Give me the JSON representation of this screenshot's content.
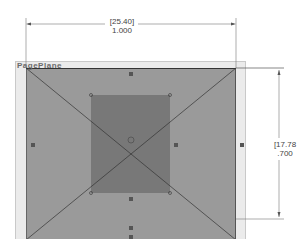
{
  "plane": {
    "label": "PagePlane"
  },
  "dimensions": {
    "width": {
      "metric": "[25.40]",
      "imperial": "1.000"
    },
    "height": {
      "metric": "[17.78",
      "imperial": ".700"
    }
  },
  "colors": {
    "outer_fill": "#9a9a9a",
    "inner_fill": "#787878",
    "plane_bg": "#ebebeb"
  }
}
